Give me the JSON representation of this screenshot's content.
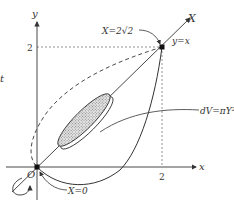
{
  "diagram": {
    "axes": {
      "x_label": "x",
      "y_label": "y",
      "origin_label": "O",
      "x_tick": "2",
      "y_tick": "2"
    },
    "rotated_axis": {
      "label": "X",
      "line_label": "y=x"
    },
    "annotations": {
      "end_point": "X=2√2",
      "start_point": "X=0",
      "volume_element": "dV=πY²dX",
      "left_edge_fragment": "t"
    },
    "colors": {
      "ink": "#333333",
      "disk_fill": "#bdbdbd",
      "guide": "#777777"
    }
  }
}
